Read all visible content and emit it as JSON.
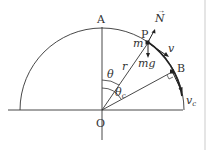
{
  "diagram": {
    "points": {
      "A": "A",
      "O": "O",
      "P": "P",
      "B": "B"
    },
    "labels": {
      "mass": "m",
      "radius": "r",
      "theta": "θ",
      "theta_c": "θ",
      "theta_c_sub": "c",
      "normal": "N",
      "weight": "mg",
      "velocity": "v",
      "velocity_c": "v",
      "velocity_c_sub": "c"
    },
    "colors": {
      "line": "#333333",
      "border": "#dddddd"
    }
  }
}
